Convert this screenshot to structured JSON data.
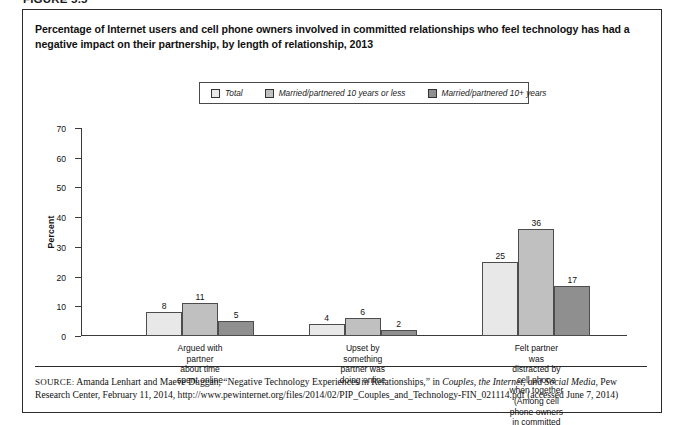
{
  "figure": {
    "label": "FIGURE 5.5",
    "title": "Percentage of Internet users and cell phone owners involved in committed relationships who feel technology has had a negative impact on their partnership, by length of relationship, 2013"
  },
  "legend": {
    "items": [
      {
        "label": "Total",
        "color": "#e8e8e8"
      },
      {
        "label": "Married/partnered 10 years or less",
        "color": "#c0c0c0"
      },
      {
        "label": "Married/partnered 10+  years",
        "color": "#8f8f8f"
      }
    ]
  },
  "axis": {
    "ylabel": "Percent",
    "yticks": [
      "0",
      "10",
      "20",
      "30",
      "40",
      "50",
      "60",
      "70"
    ]
  },
  "source": {
    "prefix": "SOURCE:",
    "text_before": " Amanda Lenhart and Maeve Duggan, “Negative Technology Experiences in Relationships,” in ",
    "italic": "Couples, the Internet, and Social Media",
    "text_after": ", Pew Research Center, February 11, 2014, http://www.pewinternet.org/files/2014/02/PIP_Couples_and_Technology-FIN_021114.pdf (accessed June 7, 2014)"
  },
  "chart_data": {
    "type": "bar",
    "title": "Percentage of Internet users and cell phone owners involved in committed relationships who feel technology has had a negative impact on their partnership, by length of relationship, 2013",
    "xlabel": "",
    "ylabel": "Percent",
    "ylim": [
      0,
      70
    ],
    "ytick_step": 10,
    "grid": false,
    "legend_position": "top-center",
    "categories": [
      "Argued with partner\nabout time spent online",
      "Upset by something\npartner was doing online",
      "Felt partner was distracted by\ncell phone when together\n(Among cell phone owners\nin committed relationships)"
    ],
    "series": [
      {
        "name": "Total",
        "color": "#e8e8e8",
        "values": [
          8,
          4,
          25
        ]
      },
      {
        "name": "Married/partnered 10 years or less",
        "color": "#c0c0c0",
        "values": [
          11,
          6,
          36
        ]
      },
      {
        "name": "Married/partnered 10+  years",
        "color": "#8f8f8f",
        "values": [
          5,
          2,
          17
        ]
      }
    ]
  }
}
